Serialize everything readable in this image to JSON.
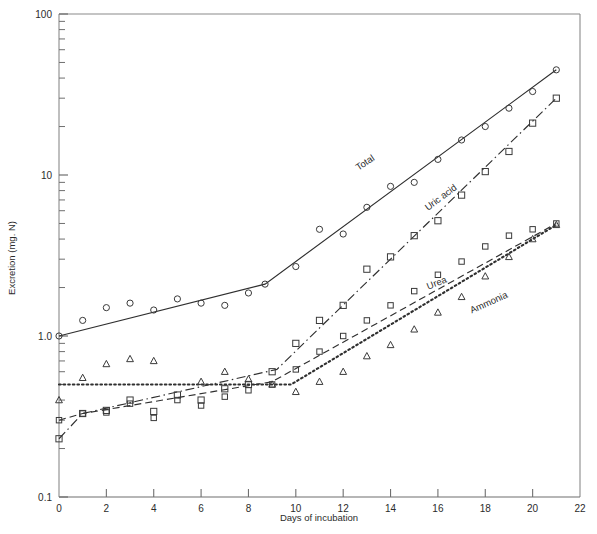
{
  "chart_data": {
    "type": "line",
    "title": "",
    "xlabel": "Days of incubation",
    "ylabel": "Excretion (mg. N)",
    "yscale": "log",
    "ylim": [
      0.1,
      100
    ],
    "xlim": [
      0,
      22
    ],
    "grid": false,
    "legend_position": "inline-curve-labels",
    "y_tick_labels": [
      "100",
      "10",
      "1.0",
      "0.1"
    ],
    "y_tick_values": [
      100,
      10,
      1.0,
      0.1
    ],
    "x_tick_labels": [
      "0",
      "2",
      "4",
      "6",
      "8",
      "10",
      "12",
      "14",
      "16",
      "18",
      "20",
      "22"
    ],
    "x_tick_values": [
      0,
      2,
      4,
      6,
      8,
      10,
      12,
      14,
      16,
      18,
      20,
      22
    ],
    "series": [
      {
        "name": "Total",
        "label": "Total",
        "linestyle": "solid",
        "marker": "open-circle",
        "line": [
          {
            "x": 0,
            "y": 1.0
          },
          {
            "x": 8.7,
            "y": 2.1
          },
          {
            "x": 21,
            "y": 45
          }
        ],
        "points": [
          {
            "x": 0,
            "y": 1.0
          },
          {
            "x": 1,
            "y": 1.25
          },
          {
            "x": 2,
            "y": 1.5
          },
          {
            "x": 3,
            "y": 1.6
          },
          {
            "x": 4,
            "y": 1.45
          },
          {
            "x": 5,
            "y": 1.7
          },
          {
            "x": 6,
            "y": 1.6
          },
          {
            "x": 7,
            "y": 1.55
          },
          {
            "x": 8,
            "y": 1.85
          },
          {
            "x": 8.7,
            "y": 2.1
          },
          {
            "x": 10,
            "y": 2.7
          },
          {
            "x": 11,
            "y": 4.6
          },
          {
            "x": 12,
            "y": 4.3
          },
          {
            "x": 13,
            "y": 6.3
          },
          {
            "x": 14,
            "y": 8.5
          },
          {
            "x": 15,
            "y": 9.0
          },
          {
            "x": 16,
            "y": 12.5
          },
          {
            "x": 17,
            "y": 16.5
          },
          {
            "x": 18,
            "y": 20.0
          },
          {
            "x": 19,
            "y": 26.0
          },
          {
            "x": 20,
            "y": 33.0
          },
          {
            "x": 21,
            "y": 45.0
          }
        ]
      },
      {
        "name": "Uric acid",
        "label": "Uric acid",
        "linestyle": "dash-dot",
        "marker": "open-square",
        "line": [
          {
            "x": 0,
            "y": 0.23
          },
          {
            "x": 1,
            "y": 0.33
          },
          {
            "x": 9.2,
            "y": 0.62
          },
          {
            "x": 21,
            "y": 30
          }
        ],
        "points": [
          {
            "x": 0,
            "y": 0.23
          },
          {
            "x": 1,
            "y": 0.33
          },
          {
            "x": 2,
            "y": 0.345
          },
          {
            "x": 3,
            "y": 0.4
          },
          {
            "x": 4,
            "y": 0.34
          },
          {
            "x": 5,
            "y": 0.43
          },
          {
            "x": 6,
            "y": 0.4
          },
          {
            "x": 7,
            "y": 0.47
          },
          {
            "x": 8,
            "y": 0.5
          },
          {
            "x": 9,
            "y": 0.6
          },
          {
            "x": 10,
            "y": 0.9
          },
          {
            "x": 11,
            "y": 1.25
          },
          {
            "x": 12,
            "y": 1.55
          },
          {
            "x": 13,
            "y": 2.6
          },
          {
            "x": 14,
            "y": 3.1
          },
          {
            "x": 15,
            "y": 4.2
          },
          {
            "x": 16,
            "y": 5.2
          },
          {
            "x": 17,
            "y": 7.5
          },
          {
            "x": 18,
            "y": 10.5
          },
          {
            "x": 19,
            "y": 14.0
          },
          {
            "x": 20,
            "y": 21.0
          },
          {
            "x": 21,
            "y": 30.0
          }
        ]
      },
      {
        "name": "Urea",
        "label": "Urea",
        "linestyle": "dashed",
        "marker": "open-square-small",
        "line": [
          {
            "x": 0,
            "y": 0.3
          },
          {
            "x": 1,
            "y": 0.33
          },
          {
            "x": 9.0,
            "y": 0.52
          },
          {
            "x": 21,
            "y": 5.0
          }
        ],
        "points": [
          {
            "x": 0,
            "y": 0.3
          },
          {
            "x": 1,
            "y": 0.33
          },
          {
            "x": 2,
            "y": 0.335
          },
          {
            "x": 3,
            "y": 0.38
          },
          {
            "x": 4,
            "y": 0.31
          },
          {
            "x": 5,
            "y": 0.4
          },
          {
            "x": 6,
            "y": 0.37
          },
          {
            "x": 7,
            "y": 0.42
          },
          {
            "x": 8,
            "y": 0.46
          },
          {
            "x": 9,
            "y": 0.5
          },
          {
            "x": 10,
            "y": 0.62
          },
          {
            "x": 11,
            "y": 0.8
          },
          {
            "x": 12,
            "y": 1.0
          },
          {
            "x": 13,
            "y": 1.25
          },
          {
            "x": 14,
            "y": 1.55
          },
          {
            "x": 15,
            "y": 1.9
          },
          {
            "x": 16,
            "y": 2.4
          },
          {
            "x": 17,
            "y": 2.9
          },
          {
            "x": 18,
            "y": 3.6
          },
          {
            "x": 19,
            "y": 4.2
          },
          {
            "x": 20,
            "y": 4.6
          },
          {
            "x": 21,
            "y": 5.0
          }
        ]
      },
      {
        "name": "Ammonia",
        "label": "Ammonia",
        "linestyle": "dotted",
        "marker": "open-triangle",
        "line": [
          {
            "x": 0,
            "y": 0.5
          },
          {
            "x": 9.8,
            "y": 0.5
          },
          {
            "x": 21,
            "y": 4.9
          }
        ],
        "points": [
          {
            "x": 0,
            "y": 0.4
          },
          {
            "x": 1,
            "y": 0.55
          },
          {
            "x": 2,
            "y": 0.67
          },
          {
            "x": 3,
            "y": 0.72
          },
          {
            "x": 4,
            "y": 0.7
          },
          {
            "x": 6,
            "y": 0.52
          },
          {
            "x": 7,
            "y": 0.6
          },
          {
            "x": 8,
            "y": 0.54
          },
          {
            "x": 9,
            "y": 0.5
          },
          {
            "x": 10,
            "y": 0.45
          },
          {
            "x": 11,
            "y": 0.52
          },
          {
            "x": 12,
            "y": 0.6
          },
          {
            "x": 13,
            "y": 0.75
          },
          {
            "x": 14,
            "y": 0.88
          },
          {
            "x": 15,
            "y": 1.1
          },
          {
            "x": 16,
            "y": 1.4
          },
          {
            "x": 17,
            "y": 1.75
          },
          {
            "x": 18,
            "y": 2.35
          },
          {
            "x": 19,
            "y": 3.1
          },
          {
            "x": 20,
            "y": 4.0
          },
          {
            "x": 21,
            "y": 4.9
          }
        ]
      }
    ],
    "curve_label_positions": [
      {
        "name": "Total",
        "x": 13.0,
        "y": 11.5,
        "rotate": -34
      },
      {
        "name": "Uric acid",
        "x": 16.2,
        "y": 7.0,
        "rotate": -37
      },
      {
        "name": "Urea",
        "x": 16.0,
        "y": 2.05,
        "rotate": -22
      },
      {
        "name": "Ammonia",
        "x": 18.2,
        "y": 1.55,
        "rotate": -24
      }
    ]
  }
}
